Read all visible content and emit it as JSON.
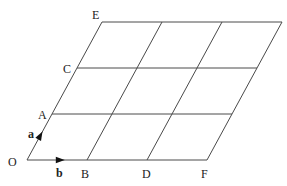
{
  "diagram": {
    "type": "parallelogram-lattice",
    "grid": {
      "rows": 3,
      "cols": 3
    },
    "origin": [
      27,
      160
    ],
    "vector_a": [
      25,
      -46
    ],
    "vector_b": [
      60,
      0
    ],
    "line_color": "#4a4a4a",
    "arrow_color": "#111111",
    "points": {
      "O": {
        "label": "O",
        "x": 27,
        "y": 160
      },
      "A": {
        "label": "A",
        "x": 52,
        "y": 114
      },
      "C": {
        "label": "C",
        "x": 77,
        "y": 68
      },
      "E": {
        "label": "E",
        "x": 102,
        "y": 22
      },
      "B": {
        "label": "B",
        "x": 87,
        "y": 160
      },
      "D": {
        "label": "D",
        "x": 147,
        "y": 160
      },
      "F": {
        "label": "F",
        "x": 207,
        "y": 160
      }
    },
    "vectors": {
      "a": {
        "label": "a"
      },
      "b": {
        "label": "b"
      }
    }
  }
}
